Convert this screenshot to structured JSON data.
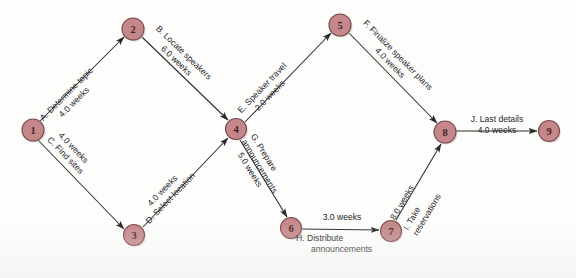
{
  "diagram": {
    "type": "activity-on-arrow network (PERT/CPM)",
    "nodes": [
      {
        "id": "1",
        "label": "1",
        "x": 33,
        "y": 130
      },
      {
        "id": "2",
        "label": "2",
        "x": 133,
        "y": 29
      },
      {
        "id": "3",
        "label": "3",
        "x": 134,
        "y": 235
      },
      {
        "id": "4",
        "label": "4",
        "x": 236,
        "y": 129
      },
      {
        "id": "5",
        "label": "5",
        "x": 340,
        "y": 25
      },
      {
        "id": "6",
        "label": "6",
        "x": 291,
        "y": 228
      },
      {
        "id": "7",
        "label": "7",
        "x": 391,
        "y": 231
      },
      {
        "id": "8",
        "label": "8",
        "x": 445,
        "y": 132
      },
      {
        "id": "9",
        "label": "9",
        "x": 549,
        "y": 131
      }
    ],
    "node_radius": 11,
    "edges": [
      {
        "id": "A",
        "from": "1",
        "to": "2",
        "activity": "A. Determine topic",
        "duration": "4.0 weeks",
        "lines": [
          "A. Determine topic",
          "4.0 weeks"
        ]
      },
      {
        "id": "B",
        "from": "2",
        "to": "4",
        "activity": "B. Locate speakers",
        "duration": "6.0 weeks",
        "lines": [
          "B. Locate speakers",
          "6.0 weeks"
        ]
      },
      {
        "id": "C",
        "from": "1",
        "to": "3",
        "activity": "C. Find sites",
        "duration": "4.0 weeks",
        "lines": [
          "4.0 weeks",
          "C. Find sites"
        ]
      },
      {
        "id": "D",
        "from": "3",
        "to": "4",
        "activity": "D. Select location",
        "duration": "4.0 weeks",
        "lines": [
          "4.0 weeks",
          "D. Select location"
        ]
      },
      {
        "id": "E",
        "from": "4",
        "to": "5",
        "activity": "E. Speaker travel",
        "duration": "2.0 weeks",
        "lines": [
          "E. Speaker travel",
          "2.0 weeks"
        ]
      },
      {
        "id": "F",
        "from": "5",
        "to": "8",
        "activity": "F. Finalize speaker plans",
        "duration": "4.0 weeks",
        "lines": [
          "F. Finalize speaker plans",
          "4.0 weeks"
        ]
      },
      {
        "id": "G",
        "from": "4",
        "to": "6",
        "activity": "G. Prepare announcements",
        "duration": "5.0 weeks",
        "lines": [
          "G. Prepare",
          "announcements"
        ],
        "duration_lines": [
          "5.0 weeks"
        ]
      },
      {
        "id": "H",
        "from": "6",
        "to": "7",
        "activity": "H. Distribute announcements",
        "duration": "3.0 weeks",
        "lines": [
          "3.0 weeks"
        ],
        "duration_lines": [
          "H.  Distribute",
          "announcements"
        ]
      },
      {
        "id": "I",
        "from": "7",
        "to": "8",
        "activity": "I. Take reservations",
        "duration": "8.0 weeks",
        "lines": [
          "8.0 weeks"
        ],
        "duration_lines": [
          "I.  Take",
          "reservations"
        ]
      },
      {
        "id": "J",
        "from": "8",
        "to": "9",
        "activity": "J. Last details",
        "duration": "4.0 weeks",
        "lines": [
          "J. Last details",
          "4.0 weeks"
        ]
      }
    ],
    "colors": {
      "node_fill": "#c4888a",
      "node_stroke": "#7d4a4c",
      "node_text": "#4a1f22",
      "edge_stroke": "#2a2a2a",
      "label_text": "#262626",
      "background": "#fdfdfc"
    }
  }
}
